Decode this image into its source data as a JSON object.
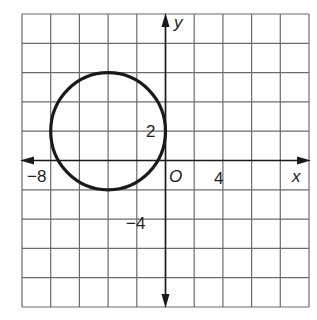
{
  "chart_data": {
    "type": "scatter",
    "title": "",
    "xlabel": "x",
    "ylabel": "y",
    "xlim": [
      -10,
      10
    ],
    "ylim": [
      -10,
      10
    ],
    "grid": true,
    "grid_step": 2,
    "origin_label": "O",
    "tick_labels": {
      "x": [
        {
          "value": -8,
          "label": "−8"
        },
        {
          "value": 4,
          "label": "4"
        }
      ],
      "y": [
        {
          "value": 2,
          "label": "2"
        },
        {
          "value": -4,
          "label": "−4"
        }
      ]
    },
    "shapes": [
      {
        "kind": "circle",
        "center": [
          -4,
          2
        ],
        "radius": 4,
        "stroke": "#1a1a1a"
      }
    ]
  },
  "colors": {
    "grid": "#6b6b6b",
    "axis": "#1a1a1a",
    "curve": "#1a1a1a",
    "text": "#231f20"
  }
}
